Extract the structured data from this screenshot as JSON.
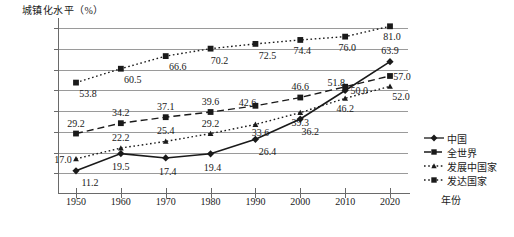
{
  "chart_data": {
    "type": "line",
    "title": "",
    "ylabel": "城镇化水平（%）",
    "xlabel": "年份",
    "grid": true,
    "legend_position": "right",
    "ylim": [
      0,
      85
    ],
    "yticks": [
      "10.0",
      "20.0",
      "30.0",
      "40.0",
      "50.0",
      "60.0",
      "70.0",
      "80.0"
    ],
    "ytick_values": [
      10,
      20,
      30,
      40,
      50,
      60,
      70,
      80
    ],
    "categories": [
      "1950",
      "1960",
      "1970",
      "1980",
      "1990",
      "2000",
      "2010",
      "2020"
    ],
    "series": [
      {
        "name": "中国",
        "marker": "diamond",
        "line": "solid",
        "values": [
          11.2,
          19.5,
          17.4,
          19.4,
          26.4,
          36.2,
          50.0,
          63.9
        ],
        "labels": [
          "11.2",
          "19.5",
          "17.4",
          "19.4",
          "26.4",
          "36.2",
          "50.0",
          "63.9"
        ]
      },
      {
        "name": "全世界",
        "marker": "square",
        "line": "dashed",
        "values": [
          29.2,
          34.2,
          37.1,
          39.6,
          42.6,
          46.6,
          51.8,
          57.0
        ],
        "labels": [
          "29.2",
          "34.2",
          "37.1",
          "39.6",
          "42.6",
          "46.6",
          "51.8",
          "57.0"
        ]
      },
      {
        "name": "发展中国家",
        "marker": "triangle",
        "line": "dotted",
        "values": [
          17.0,
          22.2,
          25.4,
          29.2,
          33.6,
          39.3,
          46.2,
          52.0
        ],
        "labels": [
          "17.0",
          "22.2",
          "25.4",
          "29.2",
          "33.6",
          "39.3",
          "46.2",
          "52.0"
        ]
      },
      {
        "name": "发达国家",
        "marker": "square",
        "line": "dotted",
        "values": [
          53.8,
          60.5,
          66.6,
          70.2,
          72.5,
          74.4,
          76.0,
          81.0
        ],
        "labels": [
          "53.8",
          "60.5",
          "66.6",
          "70.2",
          "72.5",
          "74.4",
          "76.0",
          "81.0"
        ]
      }
    ]
  },
  "colors": {
    "ink": "#1a1a1a",
    "grid": "#9a9a9a",
    "axis": "#6a6a6a"
  }
}
